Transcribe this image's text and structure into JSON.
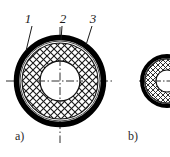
{
  "figure": {
    "background_color": "#ffffff",
    "line_color": "#000000",
    "hatch_color": "#1a1a1a",
    "core_fill": "#ffffff",
    "sheath_fill": "#000000",
    "callouts": [
      {
        "id": "callout-1",
        "label": "1",
        "meaning": "outer-sheath"
      },
      {
        "id": "callout-2",
        "label": "2",
        "meaning": "braided-shield"
      },
      {
        "id": "callout-3",
        "label": "3",
        "meaning": "outer-jacket-edge"
      }
    ],
    "subcaptions": [
      {
        "id": "subcaption-a",
        "label": "a)"
      },
      {
        "id": "subcaption-b",
        "label": "b)"
      }
    ]
  }
}
